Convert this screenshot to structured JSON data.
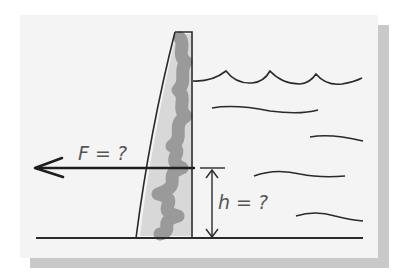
{
  "diagram": {
    "labels": {
      "force": "F = ?",
      "height": "h = ?"
    },
    "colors": {
      "card": "#f4f4f4",
      "shadow": "#c9c9c9",
      "ink": "#2a2a2a",
      "dam_fill": "#9a9a9a",
      "label": "#555555"
    },
    "elements": [
      "dam",
      "water-surface-waves",
      "water-current-lines",
      "ground-line",
      "force-arrow",
      "height-dimension"
    ]
  }
}
